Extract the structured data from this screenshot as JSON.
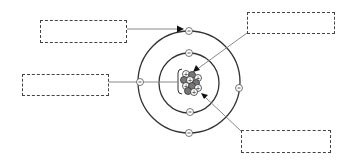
{
  "diagram": {
    "colors": {
      "line": "#333333",
      "leader": "#888888",
      "proton_fill": "#ffffff",
      "neutron_fill": "#777777",
      "box_border": "#444444"
    },
    "label_boxes": [
      {
        "id": "box-outer-shell-electron",
        "text": "",
        "x": 40,
        "y": 20,
        "w": 87,
        "h": 23,
        "points_to": "electron on outer shell"
      },
      {
        "id": "box-nucleus-proton",
        "text": "",
        "x": 247,
        "y": 12,
        "w": 88,
        "h": 22,
        "points_to": "proton in nucleus"
      },
      {
        "id": "box-nucleus",
        "text": "",
        "x": 22,
        "y": 74,
        "w": 87,
        "h": 22,
        "points_to": "nucleus (bracket)"
      },
      {
        "id": "box-nucleus-neutron",
        "text": "",
        "x": 241,
        "y": 130,
        "w": 90,
        "h": 23,
        "points_to": "neutron in nucleus"
      }
    ],
    "shells": [
      {
        "name": "inner-shell",
        "radius": 30,
        "electrons": 2
      },
      {
        "name": "outer-shell",
        "radius": 51,
        "electrons": 4
      }
    ],
    "electron_symbol": "−",
    "proton_symbol": "+"
  }
}
